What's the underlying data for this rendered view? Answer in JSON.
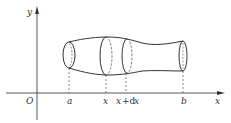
{
  "figure": {
    "type": "solid-of-revolution",
    "axes": {
      "y_label": "y",
      "x_label": "x",
      "origin_label": "O"
    },
    "ticks": [
      {
        "id": "a",
        "label": "a"
      },
      {
        "id": "x",
        "label": "x"
      },
      {
        "id": "xdx_x",
        "label": "x"
      },
      {
        "id": "xdx_plus",
        "label": "+d"
      },
      {
        "id": "xdx_x2",
        "label": "x"
      },
      {
        "id": "b",
        "label": "b"
      }
    ],
    "colors": {
      "stroke": "#333333",
      "axis": "#444444",
      "dashed": "#555555"
    }
  }
}
